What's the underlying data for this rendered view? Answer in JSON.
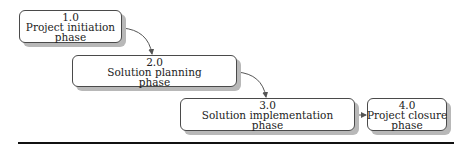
{
  "diagram": {
    "type": "phase-flow",
    "phases": [
      {
        "number": "1.0",
        "line1": "Project initiation",
        "line2": "phase"
      },
      {
        "number": "2.0",
        "line1": "Solution planning",
        "line2": "phase"
      },
      {
        "number": "3.0",
        "line1": "Solution implementation",
        "line2": "phase"
      },
      {
        "number": "4.0",
        "line1": "Project closure",
        "line2": "phase"
      }
    ],
    "connections": [
      {
        "from": "1.0",
        "to": "2.0",
        "style": "curved-arrow"
      },
      {
        "from": "2.0",
        "to": "3.0",
        "style": "curved-arrow"
      },
      {
        "from": "3.0",
        "to": "4.0",
        "style": "straight-arrow"
      }
    ],
    "colors": {
      "box_border": "#4a4a4a",
      "box_shadow": "#b8b8b8",
      "connector": "#555555",
      "rule": "#111111"
    }
  }
}
